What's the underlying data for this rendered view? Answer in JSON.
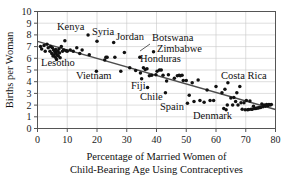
{
  "chart_data": {
    "type": "scatter",
    "title": "",
    "xlabel": "Percentage of Married Women of Child-Bearing Age Using Contraceptives",
    "xlabel_line1": "Percentage of Married Women of",
    "xlabel_line2": "Child-Bearing Age Using Contraceptives",
    "ylabel": "Births per Woman",
    "xlim": [
      0,
      80
    ],
    "ylim": [
      0,
      10
    ],
    "xticks": [
      0,
      10,
      20,
      30,
      40,
      50,
      60,
      70,
      80
    ],
    "yticks": [
      0,
      1,
      2,
      3,
      4,
      5,
      6,
      7,
      8,
      9,
      10
    ],
    "grid": true,
    "legend": "none",
    "marker_color": "#111111",
    "grid_color": "#c8c8c8",
    "axis_color": "#555555",
    "trend_color": "#4d4d4d",
    "trendline": {
      "x0": 0,
      "y0": 7.45,
      "x1": 80,
      "y1": 1.62
    },
    "points": [
      [
        1.0,
        7.0
      ],
      [
        1.4,
        6.8
      ],
      [
        2.2,
        7.1
      ],
      [
        2.6,
        6.6
      ],
      [
        3.2,
        7.2
      ],
      [
        3.6,
        6.9
      ],
      [
        4.2,
        6.6
      ],
      [
        4.4,
        7.0
      ],
      [
        4.8,
        6.4
      ],
      [
        5.0,
        6.9
      ],
      [
        5.2,
        6.2
      ],
      [
        5.4,
        6.7
      ],
      [
        5.6,
        6.3
      ],
      [
        5.8,
        6.55
      ],
      [
        6.0,
        6.1
      ],
      [
        6.1,
        6.75
      ],
      [
        6.2,
        6.45
      ],
      [
        6.4,
        5.9
      ],
      [
        6.6,
        6.3
      ],
      [
        6.8,
        6.6
      ],
      [
        7.0,
        6.2
      ],
      [
        7.2,
        6.8
      ],
      [
        7.4,
        6.45
      ],
      [
        7.6,
        6.05
      ],
      [
        8.0,
        7.0
      ],
      [
        8.4,
        6.6
      ],
      [
        8.8,
        6.7
      ],
      [
        9.2,
        7.5
      ],
      [
        9.6,
        6.65
      ],
      [
        10.0,
        6.6
      ],
      [
        11.0,
        6.7
      ],
      [
        12.0,
        6.6
      ],
      [
        13.2,
        6.9
      ],
      [
        14.2,
        6.4
      ],
      [
        15.0,
        6.7
      ],
      [
        17.0,
        8.0
      ],
      [
        17.4,
        6.3
      ],
      [
        19.8,
        4.9
      ],
      [
        20.0,
        7.45
      ],
      [
        22.6,
        5.85
      ],
      [
        23.0,
        6.1
      ],
      [
        23.4,
        6.1
      ],
      [
        25.6,
        7.35
      ],
      [
        26.0,
        6.1
      ],
      [
        28.0,
        4.9
      ],
      [
        29.2,
        6.5
      ],
      [
        31.0,
        5.2
      ],
      [
        33.0,
        4.95
      ],
      [
        34.4,
        6.1
      ],
      [
        34.6,
        4.75
      ],
      [
        35.0,
        4.25
      ],
      [
        35.6,
        5.2
      ],
      [
        36.2,
        5.05
      ],
      [
        36.8,
        5.1
      ],
      [
        37.0,
        3.5
      ],
      [
        37.6,
        4.5
      ],
      [
        38.4,
        4.55
      ],
      [
        39.0,
        6.55
      ],
      [
        39.8,
        4.6
      ],
      [
        40.2,
        4.9
      ],
      [
        41.0,
        5.0
      ],
      [
        41.6,
        5.0
      ],
      [
        42.2,
        4.55
      ],
      [
        43.0,
        3.05
      ],
      [
        43.4,
        4.05
      ],
      [
        44.0,
        4.6
      ],
      [
        46.0,
        4.3
      ],
      [
        47.0,
        4.5
      ],
      [
        47.6,
        4.55
      ],
      [
        48.0,
        4.5
      ],
      [
        48.6,
        4.55
      ],
      [
        49.0,
        4.1
      ],
      [
        50.0,
        4.1
      ],
      [
        50.4,
        2.15
      ],
      [
        51.0,
        2.85
      ],
      [
        52.0,
        3.9
      ],
      [
        52.6,
        2.3
      ],
      [
        54.0,
        4.15
      ],
      [
        54.6,
        2.4
      ],
      [
        56.0,
        2.25
      ],
      [
        57.0,
        3.3
      ],
      [
        58.0,
        2.4
      ],
      [
        59.2,
        2.4
      ],
      [
        60.0,
        3.6
      ],
      [
        62.0,
        3.05
      ],
      [
        62.6,
        1.7
      ],
      [
        63.0,
        3.35
      ],
      [
        63.4,
        1.6
      ],
      [
        63.8,
        2.0
      ],
      [
        64.0,
        3.9
      ],
      [
        65.0,
        2.6
      ],
      [
        65.6,
        2.0
      ],
      [
        66.0,
        2.65
      ],
      [
        66.6,
        2.3
      ],
      [
        67.0,
        3.05
      ],
      [
        67.4,
        2.0
      ],
      [
        68.0,
        3.6
      ],
      [
        68.4,
        2.2
      ],
      [
        68.8,
        1.65
      ],
      [
        69.4,
        2.2
      ],
      [
        69.8,
        1.6
      ],
      [
        70.2,
        2.4
      ],
      [
        70.6,
        1.6
      ],
      [
        71.0,
        1.62
      ],
      [
        71.4,
        2.35
      ],
      [
        71.8,
        1.65
      ],
      [
        72.2,
        1.65
      ],
      [
        72.6,
        1.9
      ],
      [
        73.0,
        1.7
      ],
      [
        73.4,
        1.7
      ],
      [
        73.8,
        1.75
      ],
      [
        74.2,
        1.75
      ],
      [
        74.6,
        1.8
      ],
      [
        75.0,
        1.8
      ],
      [
        75.4,
        2.1
      ],
      [
        75.8,
        1.85
      ],
      [
        76.2,
        2.0
      ],
      [
        76.6,
        1.9
      ],
      [
        77.0,
        2.05
      ],
      [
        77.4,
        1.95
      ],
      [
        77.8,
        2.05
      ],
      [
        78.2,
        2.0
      ],
      [
        78.6,
        2.05
      ]
    ],
    "annotations": [
      {
        "label": "Kenya",
        "lx": 57,
        "ly": 30,
        "align": "left"
      },
      {
        "label": "Syria",
        "lx": 92,
        "ly": 35,
        "align": "left"
      },
      {
        "label": "Jordan",
        "lx": 116,
        "ly": 40,
        "align": "left"
      },
      {
        "label": "Botswana",
        "lx": 152,
        "ly": 41,
        "align": "left"
      },
      {
        "label": "Zimbabwe",
        "lx": 157,
        "ly": 52,
        "align": "left"
      },
      {
        "label": "Honduras",
        "lx": 140,
        "ly": 62,
        "align": "left"
      },
      {
        "label": "Lesotho",
        "lx": 41,
        "ly": 66,
        "align": "left"
      },
      {
        "label": "Vietnam",
        "lx": 76,
        "ly": 79,
        "align": "left"
      },
      {
        "label": "Fiji",
        "lx": 131,
        "ly": 89,
        "align": "left"
      },
      {
        "label": "Chile",
        "lx": 140,
        "ly": 100,
        "align": "left"
      },
      {
        "label": "Spain",
        "lx": 160,
        "ly": 110,
        "align": "left"
      },
      {
        "label": "Denmark",
        "lx": 193,
        "ly": 119,
        "align": "left"
      },
      {
        "label": "Costa Rica",
        "lx": 221,
        "ly": 79,
        "align": "left"
      }
    ],
    "leader_lines": [
      {
        "x1": 150,
        "y1": 44,
        "x2": 140,
        "y2": 51
      }
    ]
  }
}
